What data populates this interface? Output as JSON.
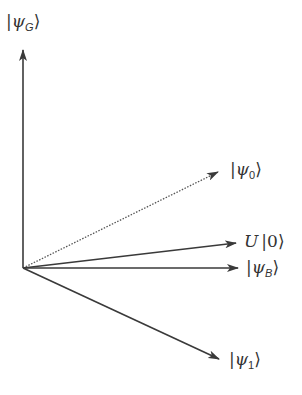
{
  "diagram": {
    "type": "vector-diagram",
    "origin": [
      23,
      268
    ],
    "vectors": [
      {
        "id": "psi_G",
        "label": "|ψG⟩",
        "symbol": "ψ",
        "subscript": "G",
        "tip": [
          23,
          50
        ],
        "style": "solid"
      },
      {
        "id": "psi_0",
        "label": "|ψ0⟩",
        "symbol": "ψ",
        "subscript": "0",
        "tip": [
          218,
          172
        ],
        "style": "dotted"
      },
      {
        "id": "U0",
        "label": "U|0⟩",
        "symbol": "U",
        "ket": "0",
        "tip": [
          236,
          243
        ],
        "style": "solid"
      },
      {
        "id": "psi_B",
        "label": "|ψB⟩",
        "symbol": "ψ",
        "subscript": "B",
        "tip": [
          238,
          268
        ],
        "style": "solid"
      },
      {
        "id": "psi_1",
        "label": "|ψ1⟩",
        "symbol": "ψ",
        "subscript": "1",
        "tip": [
          219,
          359
        ],
        "style": "solid"
      }
    ],
    "colors": {
      "line": "#3a3a3a",
      "text": "#333333"
    }
  },
  "labels": {
    "psi_G": {
      "bar": "|",
      "sym": "ψ",
      "sub": "G",
      "close": "⟩"
    },
    "psi_0": {
      "bar": "|",
      "sym": "ψ",
      "sub": "0",
      "close": "⟩"
    },
    "U0": {
      "op": "U",
      "bar": "|",
      "val": "0",
      "close": "⟩"
    },
    "psi_B": {
      "bar": "|",
      "sym": "ψ",
      "sub": "B",
      "close": "⟩"
    },
    "psi_1": {
      "bar": "|",
      "sym": "ψ",
      "sub": "1",
      "close": "⟩"
    }
  }
}
